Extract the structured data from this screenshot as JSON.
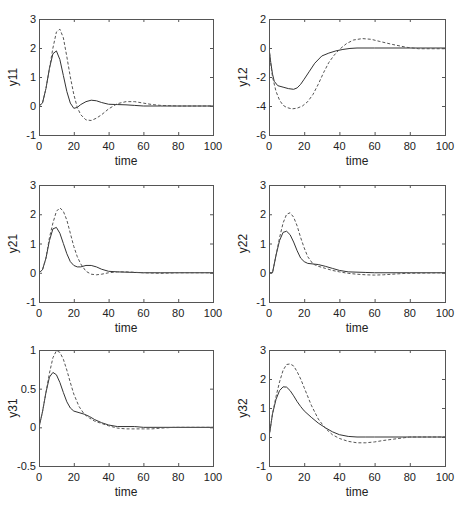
{
  "chart_data": [
    {
      "type": "line",
      "id": "y11",
      "ylabel": "y11",
      "xlabel": "time",
      "xlim": [
        0,
        100
      ],
      "ylim": [
        -1,
        3
      ],
      "xticks": [
        0,
        20,
        40,
        60,
        80,
        100
      ],
      "yticks": [
        -1,
        0,
        1,
        2,
        3
      ],
      "grid": false,
      "series": [
        {
          "name": "solid",
          "style": "solid",
          "x": [
            0,
            2,
            4,
            6,
            8,
            10,
            12,
            14,
            16,
            18,
            20,
            22,
            24,
            27,
            30,
            33,
            36,
            40,
            45,
            50,
            55,
            60,
            70,
            80,
            100
          ],
          "y": [
            0,
            0.1,
            0.6,
            1.3,
            1.8,
            1.9,
            1.6,
            1.05,
            0.5,
            0.1,
            -0.08,
            -0.05,
            0.05,
            0.15,
            0.2,
            0.18,
            0.12,
            0.06,
            0.05,
            0.04,
            0.02,
            0.0,
            0.0,
            0.0,
            0.0
          ]
        },
        {
          "name": "dashed",
          "style": "dashed",
          "x": [
            0,
            2,
            4,
            6,
            8,
            10,
            12,
            14,
            16,
            18,
            20,
            22,
            24,
            27,
            30,
            33,
            36,
            40,
            45,
            50,
            55,
            60,
            65,
            70,
            80,
            100
          ],
          "y": [
            0,
            0.1,
            0.6,
            1.3,
            2.0,
            2.55,
            2.65,
            2.35,
            1.7,
            1.0,
            0.4,
            -0.05,
            -0.3,
            -0.48,
            -0.5,
            -0.42,
            -0.3,
            -0.1,
            0.08,
            0.15,
            0.15,
            0.1,
            0.05,
            0.02,
            0.0,
            0.0
          ]
        }
      ]
    },
    {
      "type": "line",
      "id": "y12",
      "ylabel": "y12",
      "xlabel": "time",
      "xlim": [
        0,
        100
      ],
      "ylim": [
        -6,
        2
      ],
      "xticks": [
        0,
        20,
        40,
        60,
        80,
        100
      ],
      "yticks": [
        -6,
        -4,
        -2,
        0,
        2
      ],
      "grid": false,
      "series": [
        {
          "name": "solid",
          "style": "solid",
          "x": [
            0,
            1,
            2,
            3,
            5,
            8,
            11,
            14,
            16,
            18,
            20,
            23,
            26,
            30,
            34,
            38,
            42,
            46,
            50,
            60,
            80,
            100
          ],
          "y": [
            0,
            -1.0,
            -1.8,
            -2.3,
            -2.6,
            -2.7,
            -2.8,
            -2.85,
            -2.75,
            -2.5,
            -2.15,
            -1.6,
            -1.05,
            -0.55,
            -0.35,
            -0.2,
            -0.1,
            -0.03,
            0.0,
            0.0,
            0.0,
            0.0
          ]
        },
        {
          "name": "dashed",
          "style": "dashed",
          "x": [
            0,
            1,
            2,
            4,
            6,
            8,
            10,
            13,
            16,
            19,
            22,
            25,
            28,
            31,
            34,
            37,
            40,
            44,
            48,
            53,
            58,
            63,
            70,
            78,
            85,
            100
          ],
          "y": [
            0,
            -1.1,
            -2.0,
            -3.0,
            -3.6,
            -3.95,
            -4.1,
            -4.2,
            -4.15,
            -4.0,
            -3.7,
            -3.2,
            -2.5,
            -1.7,
            -1.0,
            -0.5,
            -0.1,
            0.3,
            0.55,
            0.65,
            0.6,
            0.45,
            0.25,
            0.05,
            -0.05,
            -0.05
          ]
        }
      ]
    },
    {
      "type": "line",
      "id": "y21",
      "ylabel": "y21",
      "xlabel": "time",
      "xlim": [
        0,
        100
      ],
      "ylim": [
        -1,
        3
      ],
      "xticks": [
        0,
        20,
        40,
        60,
        80,
        100
      ],
      "yticks": [
        -1,
        0,
        1,
        2,
        3
      ],
      "grid": false,
      "series": [
        {
          "name": "solid",
          "style": "solid",
          "x": [
            0,
            2,
            4,
            6,
            8,
            10,
            12,
            14,
            16,
            18,
            20,
            22,
            24,
            27,
            30,
            33,
            36,
            40,
            45,
            50,
            60,
            70,
            80,
            100
          ],
          "y": [
            0,
            0.1,
            0.5,
            1.1,
            1.5,
            1.55,
            1.35,
            1.0,
            0.65,
            0.38,
            0.25,
            0.2,
            0.2,
            0.25,
            0.25,
            0.2,
            0.12,
            0.05,
            0.03,
            0.02,
            0.0,
            0.0,
            0.0,
            0.0
          ]
        },
        {
          "name": "dashed",
          "style": "dashed",
          "x": [
            0,
            2,
            4,
            6,
            8,
            10,
            12,
            14,
            16,
            18,
            20,
            22,
            24,
            27,
            30,
            33,
            36,
            40,
            45,
            50,
            60,
            70,
            80,
            100
          ],
          "y": [
            0,
            0.1,
            0.5,
            1.2,
            1.7,
            2.1,
            2.22,
            2.1,
            1.8,
            1.35,
            0.9,
            0.55,
            0.3,
            0.05,
            -0.05,
            -0.07,
            -0.05,
            0.0,
            0.03,
            0.03,
            0.0,
            -0.02,
            0.0,
            0.0
          ]
        }
      ]
    },
    {
      "type": "line",
      "id": "y22",
      "ylabel": "y22",
      "xlabel": "time",
      "xlim": [
        0,
        100
      ],
      "ylim": [
        -1,
        3
      ],
      "xticks": [
        0,
        20,
        40,
        60,
        80,
        100
      ],
      "yticks": [
        -1,
        0,
        1,
        2,
        3
      ],
      "grid": false,
      "series": [
        {
          "name": "solid",
          "style": "solid",
          "x": [
            0,
            2,
            4,
            6,
            8,
            10,
            12,
            14,
            16,
            18,
            20,
            22,
            25,
            28,
            32,
            36,
            40,
            45,
            50,
            55,
            60,
            80,
            100
          ],
          "y": [
            0,
            0.0,
            0.6,
            1.1,
            1.38,
            1.42,
            1.3,
            1.05,
            0.75,
            0.5,
            0.38,
            0.32,
            0.3,
            0.28,
            0.22,
            0.15,
            0.08,
            0.03,
            0.02,
            0.01,
            0.0,
            0.0,
            0.0
          ]
        },
        {
          "name": "dashed",
          "style": "dashed",
          "x": [
            0,
            2,
            4,
            6,
            8,
            10,
            12,
            14,
            16,
            18,
            20,
            22,
            25,
            28,
            32,
            36,
            40,
            45,
            50,
            55,
            60,
            65,
            70,
            78,
            100
          ],
          "y": [
            0,
            0.0,
            0.6,
            1.2,
            1.7,
            2.0,
            2.05,
            1.9,
            1.6,
            1.2,
            0.85,
            0.55,
            0.3,
            0.22,
            0.15,
            0.08,
            0.03,
            -0.02,
            -0.05,
            -0.07,
            -0.08,
            -0.07,
            -0.05,
            -0.02,
            0.0
          ]
        }
      ]
    },
    {
      "type": "line",
      "id": "y31",
      "ylabel": "y31",
      "xlabel": "time",
      "xlim": [
        0,
        100
      ],
      "ylim": [
        -0.5,
        1
      ],
      "xticks": [
        0,
        20,
        40,
        60,
        80,
        100
      ],
      "yticks": [
        -0.5,
        0,
        0.5,
        1
      ],
      "grid": false,
      "series": [
        {
          "name": "solid",
          "style": "solid",
          "x": [
            0,
            2,
            4,
            6,
            8,
            10,
            12,
            14,
            16,
            18,
            20,
            23,
            26,
            29,
            32,
            36,
            40,
            45,
            50,
            55,
            60,
            80,
            100
          ],
          "y": [
            0,
            0.2,
            0.45,
            0.65,
            0.71,
            0.68,
            0.58,
            0.45,
            0.33,
            0.25,
            0.21,
            0.19,
            0.17,
            0.14,
            0.1,
            0.06,
            0.03,
            0.01,
            0.01,
            0.01,
            0.0,
            0.0,
            0.0
          ]
        },
        {
          "name": "dashed",
          "style": "dashed",
          "x": [
            0,
            2,
            4,
            6,
            8,
            10,
            12,
            14,
            16,
            18,
            20,
            23,
            26,
            29,
            32,
            36,
            40,
            45,
            50,
            55,
            60,
            65,
            70,
            78,
            100
          ],
          "y": [
            0,
            0.2,
            0.45,
            0.7,
            0.9,
            0.99,
            0.97,
            0.88,
            0.74,
            0.58,
            0.43,
            0.27,
            0.17,
            0.12,
            0.08,
            0.05,
            0.02,
            -0.01,
            -0.02,
            -0.02,
            -0.02,
            -0.02,
            -0.01,
            0.0,
            0.0
          ]
        }
      ]
    },
    {
      "type": "line",
      "id": "y32",
      "ylabel": "y32",
      "xlabel": "time",
      "xlim": [
        0,
        100
      ],
      "ylim": [
        -1,
        3
      ],
      "xticks": [
        0,
        20,
        40,
        60,
        80,
        100
      ],
      "yticks": [
        -1,
        0,
        1,
        2,
        3
      ],
      "grid": false,
      "series": [
        {
          "name": "solid",
          "style": "solid",
          "x": [
            0,
            2,
            4,
            6,
            8,
            10,
            12,
            14,
            16,
            18,
            20,
            24,
            28,
            32,
            36,
            40,
            45,
            50,
            55,
            60,
            80,
            100
          ],
          "y": [
            0,
            0.8,
            1.3,
            1.6,
            1.73,
            1.72,
            1.6,
            1.42,
            1.22,
            1.05,
            0.9,
            0.68,
            0.48,
            0.32,
            0.18,
            0.08,
            0.02,
            0.0,
            0.0,
            0.0,
            0.0,
            0.0
          ]
        },
        {
          "name": "dashed",
          "style": "dashed",
          "x": [
            0,
            2,
            4,
            6,
            8,
            10,
            12,
            14,
            16,
            18,
            20,
            24,
            28,
            32,
            36,
            40,
            45,
            50,
            55,
            60,
            65,
            70,
            75,
            80,
            100
          ],
          "y": [
            0,
            0.8,
            1.4,
            1.9,
            2.3,
            2.5,
            2.52,
            2.45,
            2.25,
            2.0,
            1.7,
            1.1,
            0.62,
            0.3,
            0.08,
            -0.05,
            -0.15,
            -0.2,
            -0.2,
            -0.17,
            -0.12,
            -0.08,
            -0.04,
            0.0,
            0.0
          ]
        }
      ]
    }
  ],
  "layout": {
    "plots": [
      {
        "left": 39,
        "top": 19,
        "width": 174,
        "height": 116
      },
      {
        "left": 269,
        "top": 19,
        "width": 176,
        "height": 116
      },
      {
        "left": 39,
        "top": 185,
        "width": 174,
        "height": 117
      },
      {
        "left": 269,
        "top": 185,
        "width": 176,
        "height": 117
      },
      {
        "left": 39,
        "top": 350,
        "width": 174,
        "height": 116
      },
      {
        "left": 269,
        "top": 350,
        "width": 176,
        "height": 116
      }
    ]
  }
}
